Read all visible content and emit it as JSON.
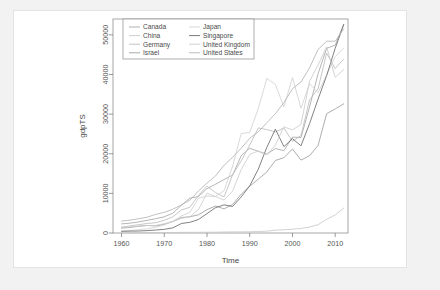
{
  "chart_data": {
    "type": "line",
    "title": "",
    "xlabel": "Time",
    "ylabel": "gdpTS",
    "xlim": [
      1958,
      2013
    ],
    "ylim": [
      0,
      54000
    ],
    "xticks": [
      1960,
      1970,
      1980,
      1990,
      2000,
      2010
    ],
    "yticks": [
      0,
      10000,
      20000,
      30000,
      40000,
      50000
    ],
    "xtick_labels": [
      "1960",
      "1970",
      "1980",
      "1990",
      "2000",
      "2010"
    ],
    "ytick_labels": [
      "0",
      "10000",
      "20000",
      "30000",
      "40000",
      "50000"
    ],
    "grid": false,
    "legend_position": "top-left",
    "legend_columns": 2,
    "x": [
      1960,
      1962,
      1964,
      1966,
      1968,
      1970,
      1972,
      1974,
      1976,
      1978,
      1980,
      1982,
      1984,
      1986,
      1988,
      1990,
      1992,
      1994,
      1996,
      1998,
      2000,
      2002,
      2004,
      2006,
      2008,
      2010,
      2012
    ],
    "series": [
      {
        "name": "Canada",
        "color": "#a8a8a8",
        "values": [
          2294,
          2480,
          2800,
          3200,
          3600,
          4100,
          5000,
          7000,
          8800,
          9200,
          11200,
          12300,
          13500,
          14600,
          19500,
          21400,
          20600,
          19900,
          21300,
          20800,
          24200,
          24100,
          31800,
          40200,
          46600,
          47400,
          52700
        ]
      },
      {
        "name": "China",
        "color": "#c9c9c9",
        "values": [
          89,
          73,
          88,
          104,
          92,
          113,
          132,
          160,
          165,
          185,
          195,
          205,
          251,
          282,
          284,
          318,
          366,
          473,
          709,
          821,
          959,
          1149,
          1509,
          2099,
          3468,
          4560,
          6300
        ]
      },
      {
        "name": "Germany",
        "color": "#bdbdbd",
        "values": [
          1500,
          1800,
          2100,
          2400,
          2600,
          3200,
          4100,
          5800,
          6500,
          9500,
          11800,
          10200,
          9100,
          14700,
          18200,
          22200,
          26500,
          26100,
          25500,
          26500,
          23100,
          24600,
          33600,
          36400,
          45400,
          41500,
          43900
        ]
      },
      {
        "name": "Israel",
        "color": "#9f9f9f",
        "values": [
          1229,
          1400,
          1700,
          1900,
          1800,
          2200,
          2900,
          3900,
          4100,
          4600,
          5900,
          6800,
          6100,
          7200,
          9800,
          11800,
          13600,
          15400,
          18300,
          19000,
          21200,
          18400,
          19500,
          22100,
          30100,
          31300,
          32600
        ]
      },
      {
        "name": "Japan",
        "color": "#d2d2d2",
        "values": [
          479,
          630,
          836,
          1060,
          1450,
          2040,
          2960,
          4300,
          5200,
          8800,
          9300,
          9200,
          10700,
          16900,
          25100,
          25400,
          31400,
          39000,
          37500,
          31800,
          39200,
          31500,
          37700,
          35400,
          39900,
          44500,
          46700
        ]
      },
      {
        "name": "Singapore",
        "color": "#6b6b6b",
        "values": [
          428,
          480,
          500,
          600,
          750,
          925,
          1300,
          2400,
          2700,
          3400,
          4900,
          6400,
          7100,
          6700,
          9100,
          11900,
          16100,
          21600,
          26200,
          21800,
          23800,
          22000,
          27600,
          33800,
          39700,
          46600,
          52600
        ]
      },
      {
        "name": "United Kingdom",
        "color": "#cccccc",
        "values": [
          1380,
          1530,
          1750,
          1900,
          1900,
          2350,
          2900,
          3700,
          4100,
          5900,
          10000,
          9200,
          8300,
          10600,
          16000,
          19800,
          20700,
          19700,
          22200,
          26800,
          26000,
          27400,
          38300,
          42400,
          47000,
          39300,
          41200
        ]
      },
      {
        "name": "United States",
        "color": "#b5b5b5",
        "values": [
          3007,
          3250,
          3600,
          4000,
          4700,
          5200,
          6000,
          7100,
          8300,
          10600,
          12600,
          14400,
          17100,
          19100,
          21400,
          23900,
          25500,
          27800,
          30100,
          32900,
          36400,
          38100,
          41700,
          46300,
          48400,
          48400,
          51500
        ]
      }
    ]
  },
  "axes": {
    "ylabel": "gdpTS",
    "xlabel": "Time"
  },
  "legend": {
    "column_left": [
      {
        "label": "Canada",
        "color": "#a8a8a8"
      },
      {
        "label": "China",
        "color": "#c9c9c9"
      },
      {
        "label": "Germany",
        "color": "#bdbdbd"
      },
      {
        "label": "Israel",
        "color": "#9f9f9f"
      }
    ],
    "column_right": [
      {
        "label": "Japan",
        "color": "#d2d2d2"
      },
      {
        "label": "Singapore",
        "color": "#6b6b6b"
      },
      {
        "label": "United Kingdom",
        "color": "#cccccc"
      },
      {
        "label": "United States",
        "color": "#b5b5b5"
      }
    ]
  }
}
